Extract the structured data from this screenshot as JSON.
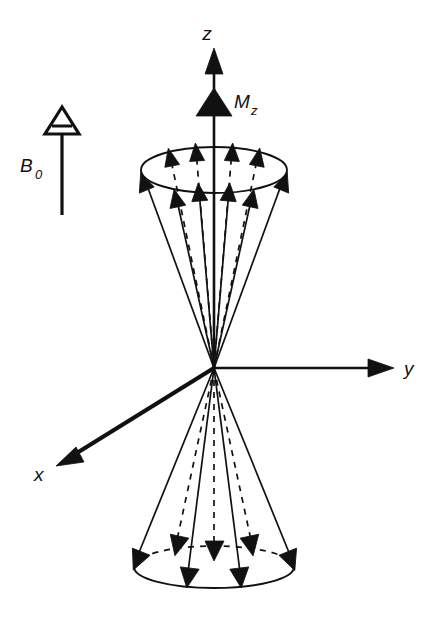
{
  "figure": {
    "background_color": "#ffffff",
    "ink_color": "#111111"
  },
  "labels": {
    "z_axis": "z",
    "y_axis": "y",
    "x_axis": "x",
    "magnetization": "M",
    "magnetization_subscript": "z",
    "field": "B",
    "field_subscript": "0"
  },
  "axes": {
    "origin": {
      "x": 214,
      "y": 368
    },
    "z": {
      "name": "z-axis",
      "from": {
        "x": 214,
        "y": 368
      },
      "to": {
        "x": 214,
        "y": 48
      },
      "arrowhead": "solid-up",
      "label_position": {
        "x": 207,
        "y": 40
      }
    },
    "y": {
      "name": "y-axis",
      "from": {
        "x": 214,
        "y": 368
      },
      "to": {
        "x": 392,
        "y": 368
      },
      "arrowhead": "solid-right",
      "label_position": {
        "x": 404,
        "y": 374
      }
    },
    "x": {
      "name": "x-axis",
      "from": {
        "x": 214,
        "y": 368
      },
      "to": {
        "x": 58,
        "y": 465
      },
      "arrowhead": "solid-down-left",
      "label_position": {
        "x": 36,
        "y": 480
      }
    }
  },
  "magnetization_vector": {
    "name": "Mz-vector",
    "tip": {
      "x": 214,
      "y": 105
    },
    "arrowhead": "solid-up-wide",
    "label_position": {
      "x": 235,
      "y": 108
    }
  },
  "field_vector": {
    "name": "B0-vector",
    "from": {
      "x": 62,
      "y": 215
    },
    "to": {
      "x": 62,
      "y": 120
    },
    "arrowhead": "hollow-triangle-with-bar",
    "label_position": {
      "x": 22,
      "y": 168
    }
  },
  "upper_cone": {
    "name": "upper-precession-cone",
    "apex": {
      "x": 214,
      "y": 368
    },
    "rim_center": {
      "x": 214,
      "y": 170
    },
    "rim_rx": 73,
    "rim_ry": 23,
    "vector_count_solid": 6,
    "vector_count_dashed": 4,
    "rim_style": "solid-ellipse"
  },
  "lower_cone": {
    "name": "lower-precession-cone",
    "apex": {
      "x": 214,
      "y": 368
    },
    "rim_center": {
      "x": 214,
      "y": 567
    },
    "rim_rx": 80,
    "rim_ry": 21,
    "vector_count_solid": 4,
    "vector_count_dashed": 3,
    "rim_style": "solid-front-arc-dashed-back-arc"
  }
}
